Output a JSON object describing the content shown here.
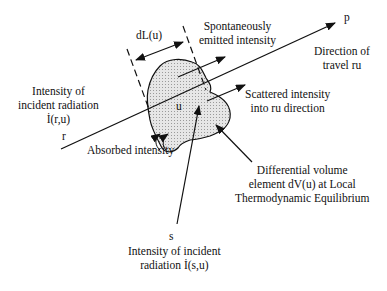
{
  "diagram": {
    "colors": {
      "line": "#111111",
      "volume_fill": "#d8d8d8",
      "background": "#ffffff"
    },
    "labels": {
      "dL": "dL(u)",
      "spontaneous_1": "Spontaneously",
      "spontaneous_2": "emitted intensity",
      "p": "p",
      "direction_1": "Direction of",
      "direction_2": "travel ru",
      "incident_r_1": "Intensity of",
      "incident_r_2": "incident radiation",
      "incident_r_3": "İ(r,u)",
      "r": "r",
      "u": "u",
      "scattered_1": "Scattered intensity",
      "scattered_2": "into ru direction",
      "absorbed": "Absorbed intensity",
      "volume_1": "Differential volume",
      "volume_2": "element dV(u) at Local",
      "volume_3": "Thermodynamic Equilibrium",
      "s": "s",
      "incident_s_1": "Intensity of incident",
      "incident_s_2": "radiation İ(s,u)"
    }
  }
}
